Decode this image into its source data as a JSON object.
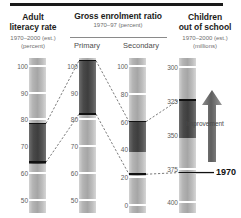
{
  "chart_data": {
    "type": "bar",
    "title": "",
    "subtitle": "",
    "layout": "four vertical gradient strip scales with dark range bands and dashed connectors",
    "grid": false,
    "legend": "none",
    "columns": [
      {
        "id": "adult-literacy-rate",
        "title": "Adult\nliteracy rate",
        "title_line1": "Adult",
        "title_line2": "literacy rate",
        "subtitle_line1": "1970–2000 (est.)",
        "subtitle_line2": "(percent)",
        "ylabel": "percent",
        "ticks": [
          100,
          90,
          80,
          70,
          60,
          50
        ],
        "ylim": [
          45,
          103
        ],
        "axis_direction": "high-at-top",
        "band": {
          "from": 63.5,
          "to": 78.5,
          "label": "range 1970–2000"
        },
        "markers": [
          78.5,
          64.0
        ]
      },
      {
        "id": "gross-enrolment-primary",
        "group_title_line1": "Gross enrolment ratio",
        "group_subtitle": "1970–97 (percent)",
        "title": "Primary",
        "ylabel": "percent",
        "ticks": [
          100,
          90,
          80,
          70,
          60,
          50
        ],
        "ylim": [
          45,
          103
        ],
        "axis_direction": "high-at-top",
        "band": {
          "from": 81.5,
          "to": 102.0,
          "label": "range 1970–97"
        },
        "markers": [
          102.0,
          82.0
        ]
      },
      {
        "id": "gross-enrolment-secondary",
        "title": "Secondary",
        "ylabel": "percent",
        "ticks": [
          100,
          80,
          60,
          40,
          20,
          0
        ],
        "ylim": [
          -6,
          106
        ],
        "axis_direction": "high-at-top",
        "band": {
          "from": 38.0,
          "to": 60.0,
          "label": "range 1970–97"
        },
        "markers": [
          60.0,
          22.0
        ]
      },
      {
        "id": "children-out-of-school",
        "title_line1": "Children",
        "title_line2": "out of school",
        "subtitle_line1": "1970–2000 (est.)",
        "subtitle_line2": "(millions)",
        "ylabel": "millions",
        "ticks": [
          300,
          325,
          350,
          375,
          400
        ],
        "ylim": [
          293,
          408
        ],
        "axis_direction": "low-at-top",
        "band": {
          "from": 325.0,
          "to": 352.0,
          "label": "range 1970–2000"
        },
        "markers": [
          324.0,
          378.0
        ]
      }
    ],
    "connectors": [
      {
        "from_col": 0,
        "from_value": 78.5,
        "to_col": 1,
        "to_value": 102.0
      },
      {
        "from_col": 0,
        "from_value": 64.0,
        "to_col": 1,
        "to_value": 82.0
      },
      {
        "from_col": 1,
        "from_value": 102.0,
        "to_col": 2,
        "to_value": 60.0
      },
      {
        "from_col": 1,
        "from_value": 82.0,
        "to_col": 2,
        "to_value": 22.0
      },
      {
        "from_col": 2,
        "from_value": 60.0,
        "to_col": 3,
        "to_value": 324.0
      },
      {
        "from_col": 2,
        "from_value": 22.0,
        "to_col": 3,
        "to_value": 378.0
      }
    ],
    "annotations": [
      {
        "id": "improvement",
        "text": "Improvement",
        "type": "arrow-label",
        "direction": "up"
      },
      {
        "id": "baseline-year",
        "text": "1970",
        "type": "reference-line-label",
        "column": "children-out-of-school",
        "value": 378.0
      }
    ]
  },
  "header": {
    "col1": {
      "title_line1": "Adult",
      "title_line2": "literacy rate",
      "sub_line1": "1970–2000 (est.)",
      "sub_line2": "(percent)"
    },
    "col23": {
      "title": "Gross enrolment ratio",
      "sub": "1970–97 (percent)",
      "primary_label": "Primary",
      "secondary_label": "Secondary"
    },
    "col4": {
      "title_line1": "Children",
      "title_line2": "out of school",
      "sub_line1": "1970–2000 (est.)",
      "sub_line2": "(millions)"
    }
  },
  "annotations": {
    "improvement": "Improvement",
    "year": "1970"
  },
  "colors": {
    "ink": "#231f20",
    "muted": "#6e6e6e",
    "band_dark": "#595959",
    "strip_light": "#c9c9c9",
    "strip_mid": "#aeaeae",
    "marker": "#111111",
    "rule": "#1a1a1a"
  }
}
